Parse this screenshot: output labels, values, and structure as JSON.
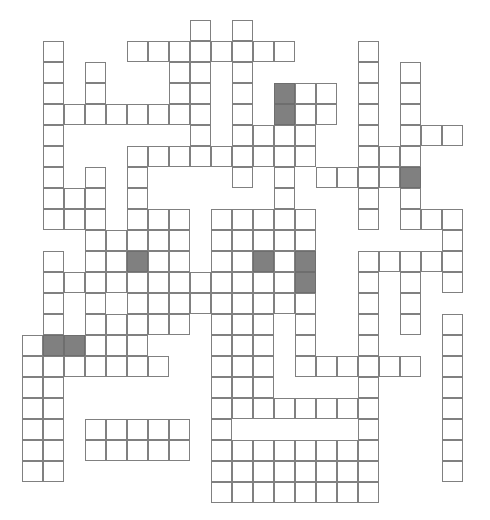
{
  "puzzle": {
    "kind": "crossword-grid",
    "title": "Crossword Grid",
    "columns": 22,
    "rows": 23,
    "cell_size_px": 21,
    "origin_x_px": 22,
    "origin_y_px": 20,
    "colors": {
      "background": "#ffffff",
      "cell_fill": "#ffffff",
      "cell_border": "#808080",
      "shaded_cell_fill": "#808080"
    },
    "legend": {
      "open_cell_label": "open-cell",
      "shaded_cell_label": "shaded-cell"
    },
    "counts": {
      "open_cells": 312,
      "shaded_cells": 8
    },
    "rows_cells": [
      {
        "row": 0,
        "cols": [
          8,
          10
        ]
      },
      {
        "row": 1,
        "cols": [
          1,
          5,
          6,
          7,
          8,
          9,
          10,
          11,
          12,
          16
        ]
      },
      {
        "row": 2,
        "cols": [
          1,
          3,
          7,
          8,
          10,
          16,
          18
        ]
      },
      {
        "row": 3,
        "cols": [
          1,
          3,
          7,
          8,
          10,
          12,
          13,
          14,
          16,
          18
        ]
      },
      {
        "row": 4,
        "cols": [
          1,
          2,
          3,
          4,
          5,
          6,
          7,
          8,
          10,
          12,
          13,
          14,
          16,
          18
        ]
      },
      {
        "row": 5,
        "cols": [
          1,
          8,
          10,
          11,
          12,
          13,
          16,
          18,
          19,
          20
        ]
      },
      {
        "row": 6,
        "cols": [
          1,
          5,
          6,
          7,
          8,
          9,
          10,
          11,
          12,
          13,
          16,
          17,
          18
        ]
      },
      {
        "row": 7,
        "cols": [
          1,
          3,
          5,
          10,
          12,
          14,
          15,
          16,
          17,
          18
        ]
      },
      {
        "row": 8,
        "cols": [
          1,
          2,
          3,
          5,
          12,
          16,
          18
        ]
      },
      {
        "row": 9,
        "cols": [
          1,
          2,
          3,
          5,
          6,
          7,
          9,
          10,
          11,
          12,
          13,
          16,
          18,
          19,
          20
        ]
      },
      {
        "row": 10,
        "cols": [
          3,
          4,
          5,
          6,
          7,
          9,
          10,
          11,
          12,
          13,
          20
        ]
      },
      {
        "row": 11,
        "cols": [
          1,
          3,
          4,
          5,
          6,
          7,
          9,
          10,
          11,
          12,
          13,
          16,
          17,
          18,
          19,
          20
        ]
      },
      {
        "row": 12,
        "cols": [
          1,
          2,
          3,
          4,
          5,
          6,
          7,
          8,
          9,
          10,
          11,
          12,
          13,
          16,
          18,
          20
        ]
      },
      {
        "row": 13,
        "cols": [
          1,
          3,
          5,
          6,
          7,
          8,
          9,
          10,
          11,
          12,
          13,
          16,
          18
        ]
      },
      {
        "row": 14,
        "cols": [
          1,
          3,
          4,
          5,
          6,
          7,
          9,
          10,
          11,
          13,
          16,
          18,
          20
        ]
      },
      {
        "row": 15,
        "cols": [
          0,
          1,
          2,
          3,
          4,
          5,
          9,
          10,
          11,
          13,
          16,
          20
        ]
      },
      {
        "row": 16,
        "cols": [
          0,
          1,
          2,
          3,
          4,
          5,
          6,
          9,
          10,
          11,
          13,
          14,
          15,
          16,
          17,
          18,
          20
        ]
      },
      {
        "row": 17,
        "cols": [
          0,
          1,
          9,
          10,
          11,
          16,
          20
        ]
      },
      {
        "row": 18,
        "cols": [
          0,
          1,
          9,
          10,
          11,
          12,
          13,
          14,
          15,
          16,
          20
        ]
      },
      {
        "row": 19,
        "cols": [
          0,
          1,
          3,
          4,
          5,
          6,
          7,
          9,
          16,
          20
        ]
      },
      {
        "row": 20,
        "cols": [
          0,
          1,
          3,
          4,
          5,
          6,
          7,
          9,
          10,
          11,
          12,
          13,
          14,
          15,
          16,
          20
        ]
      },
      {
        "row": 21,
        "cols": [
          0,
          1,
          9,
          10,
          11,
          12,
          13,
          14,
          15,
          16,
          20
        ]
      },
      {
        "row": 22,
        "cols": [
          9,
          10,
          11,
          12,
          13,
          14,
          15,
          16
        ]
      }
    ],
    "shaded_cells": [
      {
        "row": 3,
        "col": 12
      },
      {
        "row": 4,
        "col": 12
      },
      {
        "row": 7,
        "col": 18
      },
      {
        "row": 11,
        "col": 5
      },
      {
        "row": 11,
        "col": 11
      },
      {
        "row": 11,
        "col": 13
      },
      {
        "row": 12,
        "col": 13
      },
      {
        "row": 15,
        "col": 1
      },
      {
        "row": 15,
        "col": 2
      }
    ]
  }
}
